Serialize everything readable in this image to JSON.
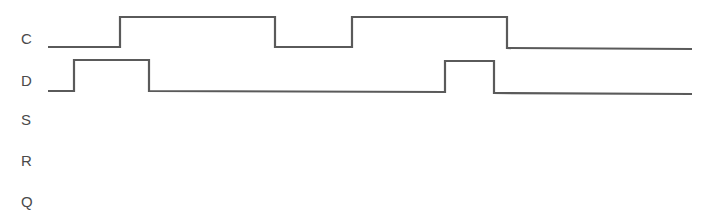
{
  "diagram": {
    "type": "timing-diagram",
    "line_color": "#5a5a5a",
    "label_color": "#4a4a4a",
    "signals": [
      {
        "name": "C",
        "label_y": 38,
        "high_y": 17,
        "low_y": 47,
        "points": [
          [
            48,
            47
          ],
          [
            120,
            47
          ],
          [
            120,
            17
          ],
          [
            275,
            17
          ],
          [
            275,
            47
          ],
          [
            352,
            47
          ],
          [
            352,
            17
          ],
          [
            507,
            17
          ],
          [
            507,
            48
          ],
          [
            692,
            49
          ]
        ]
      },
      {
        "name": "D",
        "label_y": 80,
        "high_y": 60,
        "low_y": 91,
        "points": [
          [
            48,
            91
          ],
          [
            74,
            91
          ],
          [
            74,
            60
          ],
          [
            149,
            60
          ],
          [
            149,
            91
          ],
          [
            445,
            92
          ],
          [
            445,
            61
          ],
          [
            494,
            61
          ],
          [
            494,
            93
          ],
          [
            692,
            94
          ]
        ]
      },
      {
        "name": "S",
        "label_y": 119,
        "points": []
      },
      {
        "name": "R",
        "label_y": 160,
        "points": []
      },
      {
        "name": "Q",
        "label_y": 201,
        "points": []
      }
    ]
  }
}
